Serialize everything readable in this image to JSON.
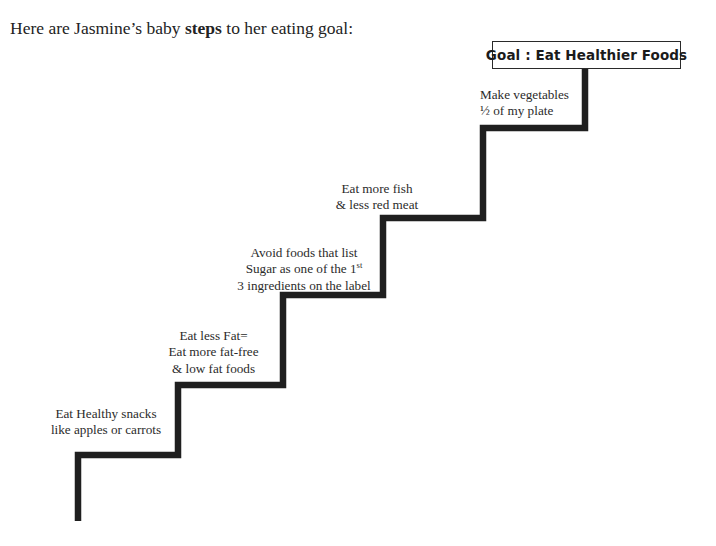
{
  "title": {
    "before": "Here are Jasmine’s baby ",
    "emphasis": "steps",
    "after": " to her eating goal:"
  },
  "goal": {
    "label": "Goal : Eat Healthier Foods"
  },
  "colors": {
    "stair_line": "#1f1f1f",
    "text": "#2b2b2b",
    "background": "#ffffff",
    "goal_border": "#2a2a2a"
  },
  "steps": [
    {
      "id": "step-1",
      "lines": [
        "Eat Healthy snacks",
        "like apples or carrots"
      ]
    },
    {
      "id": "step-2",
      "lines": [
        "Eat less Fat=",
        "Eat more fat-free",
        "& low fat foods"
      ]
    },
    {
      "id": "step-3",
      "lines": [
        "Avoid foods that list",
        "Sugar as one of the 1",
        "3 ingredients on the label"
      ],
      "superscript": "st"
    },
    {
      "id": "step-4",
      "lines": [
        "Eat more fish",
        "& less red meat"
      ]
    },
    {
      "id": "step-5",
      "lines": [
        "Make vegetables",
        "½ of my plate"
      ]
    }
  ]
}
